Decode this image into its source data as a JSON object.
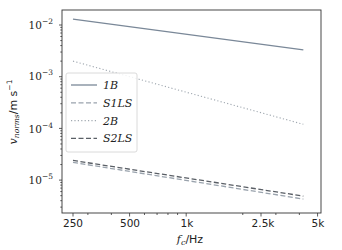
{
  "chart_data": {
    "type": "line",
    "title": "",
    "xlabel": "f_c/Hz",
    "ylabel": "v_norms/m s^-1",
    "xscale": "log",
    "yscale": "log",
    "xlim": [
      220,
      5000
    ],
    "ylim": [
      3.5e-06,
      0.02
    ],
    "xticks": [
      250,
      500,
      1000,
      2500,
      5000
    ],
    "xtick_labels": [
      "250",
      "500",
      "1k",
      "2.5k",
      "5k"
    ],
    "yticks": [
      0.01,
      0.001,
      0.0001,
      1e-05
    ],
    "ytick_labels": [
      "10^-2",
      "10^-3",
      "10^-4",
      "10^-5"
    ],
    "grid": false,
    "legend_position": "center left",
    "x": [
      250,
      4200
    ],
    "series": [
      {
        "name": "1B",
        "style": "solid",
        "color": "#7a8898",
        "values": [
          0.013,
          0.0033
        ]
      },
      {
        "name": "S1LS",
        "style": "dashed",
        "color": "#9aa3ad",
        "values": [
          2.2e-05,
          4.3e-06
        ]
      },
      {
        "name": "2B",
        "style": "dotted",
        "color": "#a0a8b0",
        "values": [
          0.002,
          0.00012
        ]
      },
      {
        "name": "S2LS",
        "style": "dashed",
        "color": "#5a5f66",
        "values": [
          2.4e-05,
          4.9e-06
        ]
      }
    ]
  },
  "labels": {
    "xlabel_main": "f",
    "xlabel_sub": "c",
    "xlabel_unit": "/Hz",
    "ylabel_main": "v",
    "ylabel_sub": "norms",
    "ylabel_unit": "/m s",
    "ylabel_exp": "−1",
    "ytick_base": "10",
    "ytick_exps": [
      "−2",
      "−3",
      "−4",
      "−5"
    ],
    "xtick_texts": [
      "250",
      "500",
      "1k",
      "2.5k",
      "5k"
    ],
    "legend": [
      "1B",
      "S1LS",
      "2B",
      "S2LS"
    ]
  }
}
